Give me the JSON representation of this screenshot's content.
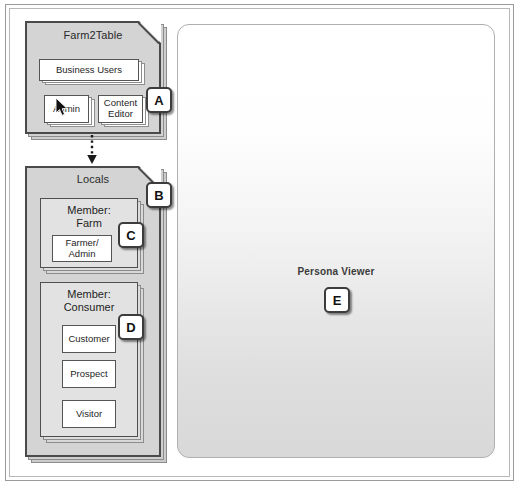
{
  "diagram": {
    "title_hidden": "",
    "org_container": {
      "label": "Farm2Table",
      "cards": [
        {
          "label": "Business Users"
        },
        {
          "label": "Admin"
        },
        {
          "label": "Content Editor"
        }
      ],
      "badge": "A"
    },
    "locals_container": {
      "label": "Locals",
      "badge": "B",
      "groups": [
        {
          "label": "Member: Farm",
          "label_line1": "Member:",
          "label_line2": "Farm",
          "badge": "C",
          "cards": [
            {
              "label": "Farmer/ Admin",
              "line1": "Farmer/",
              "line2": "Admin"
            }
          ]
        },
        {
          "label": "Member: Consumer",
          "label_line1": "Member:",
          "label_line2": "Consumer",
          "badge": "D",
          "cards": [
            {
              "label": "Customer"
            },
            {
              "label": "Prospect"
            },
            {
              "label": "Visitor"
            }
          ]
        }
      ]
    },
    "connector": {
      "style": "dotted-arrow-down",
      "from": "Farm2Table",
      "to": "Locals"
    },
    "viewer": {
      "label": "Persona Viewer",
      "badge": "E"
    },
    "cursor": {
      "icon": "mouse-pointer",
      "over": "Admin"
    },
    "colors": {
      "container_fill": "#d4d4d4",
      "group_fill": "#e2e2e2",
      "card_fill": "#ffffff",
      "stroke": "#4a4a4a",
      "badge_border": "#3c3c3c",
      "viewer_top": "#ffffff",
      "viewer_bottom": "#d8d8d8"
    }
  }
}
